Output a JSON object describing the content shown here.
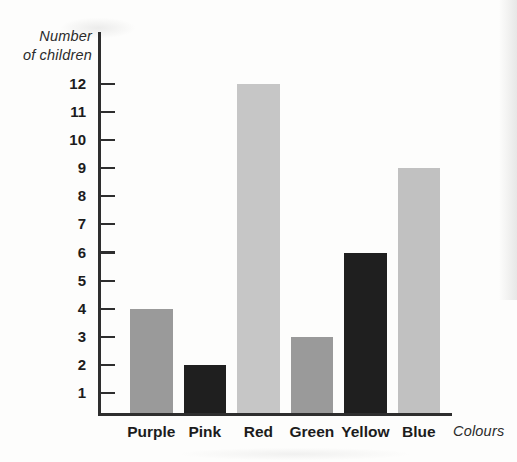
{
  "chart_data": {
    "type": "bar",
    "title": "",
    "categories": [
      "Purple",
      "Pink",
      "Red",
      "Green",
      "Yellow",
      "Blue"
    ],
    "values": [
      4,
      2,
      12,
      3,
      6,
      9
    ],
    "bar_colors": [
      "#9a9a9a",
      "#1f1f1f",
      "#c6c6c6",
      "#9a9a9a",
      "#1f1f1f",
      "#c1c1c1"
    ],
    "xlabel": "Colours",
    "ylabel": "Number of children",
    "ylabel_lines": [
      "Number",
      "of children"
    ],
    "ylim": [
      0,
      12
    ],
    "yticks": [
      1,
      2,
      3,
      4,
      5,
      6,
      7,
      8,
      9,
      10,
      11,
      12
    ],
    "grid": false,
    "legend": false
  },
  "colors": {
    "axis": "#2e2e2e",
    "tick_text": "#1c1c1c",
    "category_text": "#1c1c1c",
    "axis_label_text": "#2b2b2b",
    "background": "#fdfdfc"
  }
}
